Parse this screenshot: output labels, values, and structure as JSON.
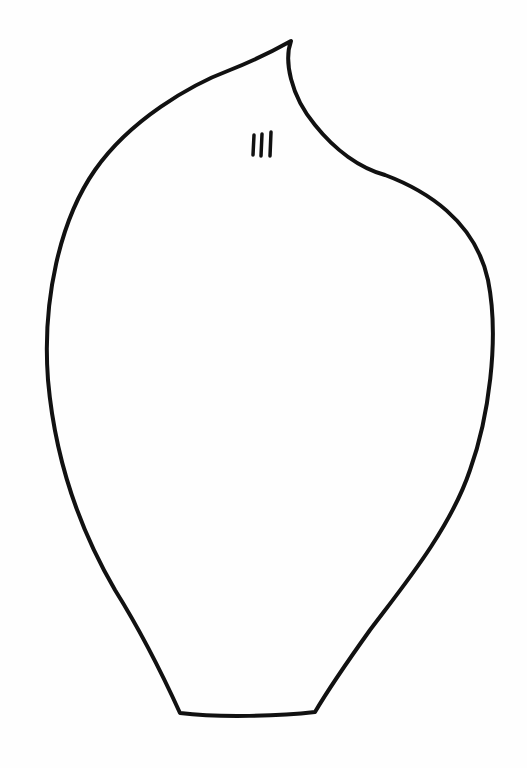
{
  "drawing": {
    "subject": "petal-template-outline",
    "label_marks": "III",
    "stroke_color": "#111111",
    "background_color": "#fefefe"
  }
}
